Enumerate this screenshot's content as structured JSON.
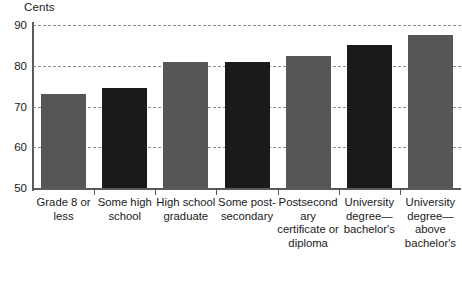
{
  "chart_data": {
    "type": "bar",
    "title": "",
    "subtitle": "",
    "unit_caption": "Cents",
    "xlabel": "",
    "ylabel": "Cents",
    "ylim": [
      50,
      90
    ],
    "yticks": [
      50,
      60,
      70,
      80,
      90
    ],
    "grid": true,
    "legend": "none",
    "categories": [
      "Grade 8 or less",
      "Some high school",
      "High school graduate",
      "Some post-secondary",
      "Postsecondary certificate or diploma",
      "University degree—bachelor's",
      "University degree—above bachelor's"
    ],
    "values": [
      73,
      74.5,
      81,
      81,
      82.5,
      85,
      87.5
    ],
    "bar_colors": [
      "#565656",
      "#1a1a1a",
      "#565656",
      "#1a1a1a",
      "#565656",
      "#1a1a1a",
      "#565656"
    ]
  },
  "colors": {
    "bar_gray": "#565656",
    "bar_black": "#1a1a1a",
    "axis": "#5a5a5a",
    "gridline": "#8e8e8e",
    "background": "#ffffff",
    "text": "#1a1a1a"
  }
}
